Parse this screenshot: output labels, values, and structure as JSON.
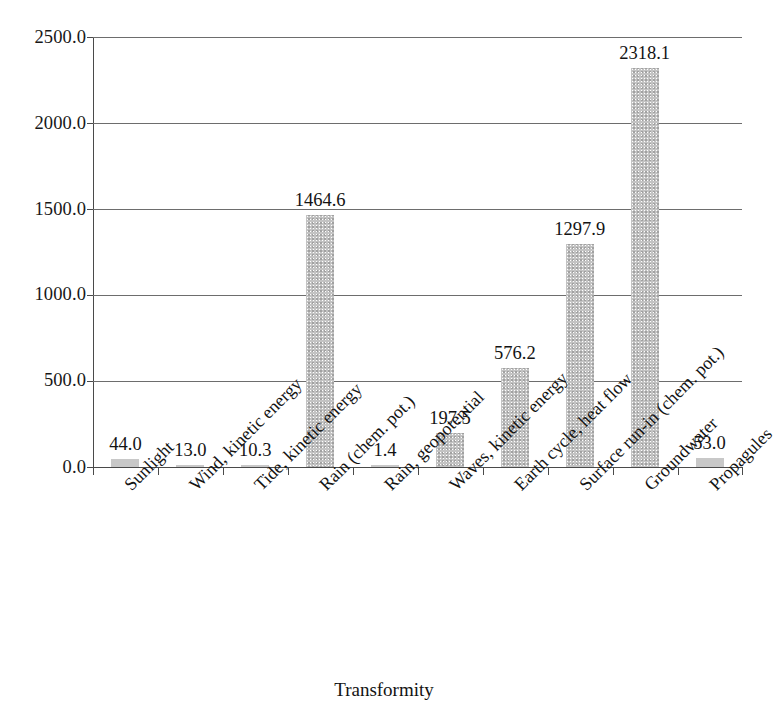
{
  "chart_data": {
    "type": "bar",
    "title": "",
    "xlabel": "Transformity",
    "ylabel": "",
    "categories": [
      "Sunlight",
      "Wind, kinetic energy",
      "Tide, kinetic energy",
      "Rain (chem. pot.)",
      "Rain, geopotential",
      "Waves, kinetic energy",
      "Earth cycle, heat flow",
      "Surface run-in (chem. pot.)",
      "Groundwater",
      "Propagules"
    ],
    "values": [
      44.0,
      13.0,
      10.3,
      1464.6,
      1.4,
      197.5,
      576.2,
      1297.9,
      2318.1,
      53.0
    ],
    "value_labels": [
      "44.0",
      "13.0",
      "10.3",
      "1464.6",
      "1.4",
      "197.5",
      "576.2",
      "1297.9",
      "2318.1",
      "53.0"
    ],
    "ylim": [
      0,
      2500
    ],
    "ytick_values": [
      0,
      500,
      1000,
      1500,
      2000,
      2500
    ],
    "ytick_labels": [
      "0.0",
      "500.0",
      "1000.0",
      "1500.0",
      "2000.0",
      "2500.0"
    ],
    "grid": true,
    "legend": "none",
    "bar_color": "#c3c3c3",
    "axis_color": "#4a4a4a",
    "text_color": "#131313",
    "background_color": "#ffffff",
    "label_rotation_degrees": -45
  },
  "figure": {
    "header_remnant": "",
    "axis_title_text": "Transformity"
  }
}
